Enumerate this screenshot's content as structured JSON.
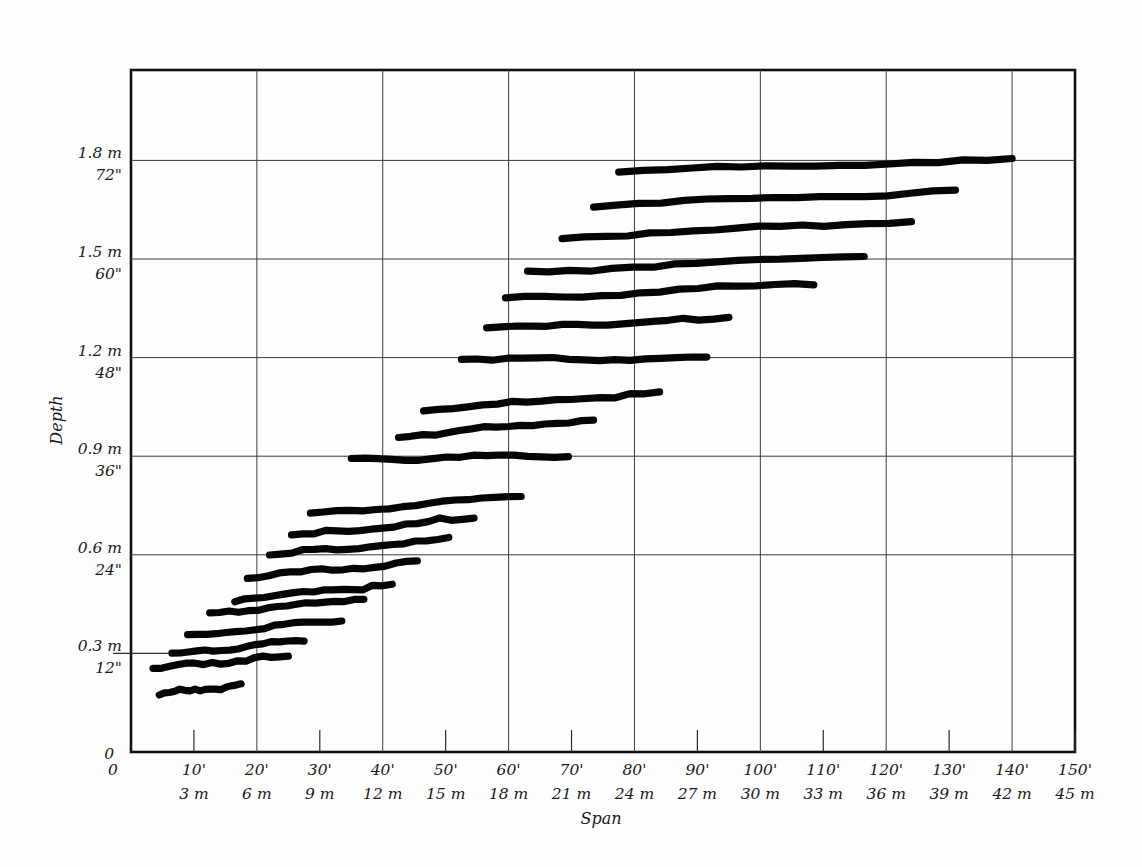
{
  "chart_data": {
    "type": "line",
    "title": "",
    "xlabel": "Span",
    "ylabel": "Depth",
    "xlim": [
      0,
      150
    ],
    "ylim": [
      0,
      2.25
    ],
    "grid": true,
    "legend_position": "none",
    "x_axis": {
      "primary_unit": "feet",
      "secondary_unit": "meters",
      "origin_label": "0",
      "ticks_feet": [
        "0",
        "10'",
        "20'",
        "30'",
        "40'",
        "50'",
        "60'",
        "70'",
        "80'",
        "90'",
        "100'",
        "110'",
        "120'",
        "130'",
        "140'",
        "150'"
      ],
      "ticks_meters": [
        "",
        "3 m",
        "6 m",
        "9 m",
        "12 m",
        "15 m",
        "18 m",
        "21 m",
        "24 m",
        "27 m",
        "30 m",
        "33 m",
        "36 m",
        "39 m",
        "42 m",
        "45 m"
      ],
      "tick_values_feet": [
        0,
        10,
        20,
        30,
        40,
        50,
        60,
        70,
        80,
        90,
        100,
        110,
        120,
        130,
        140,
        150
      ],
      "major_gridline_feet": [
        20,
        40,
        60,
        80,
        100,
        120,
        140
      ]
    },
    "y_axis": {
      "primary_unit": "meters",
      "secondary_unit": "inches",
      "origin_label": "0",
      "ticks_meters": [
        "0.3 m",
        "0.6 m",
        "0.9 m",
        "1.2 m",
        "1.5 m",
        "1.8 m"
      ],
      "ticks_inches": [
        "12\"",
        "24\"",
        "36\"",
        "48\"",
        "60\"",
        "72\""
      ],
      "tick_values_meters": [
        0.3,
        0.6,
        0.9,
        1.2,
        1.5,
        1.8
      ],
      "major_gridline_meters": [
        0.6,
        0.9,
        1.2,
        1.5,
        1.8
      ],
      "minor_tick_meters": [
        0.3
      ]
    },
    "series": [
      {
        "name": "band-01",
        "x_start_ft": 4.5,
        "x_end_ft": 17.5,
        "y_start_m": 0.175,
        "y_end_m": 0.205
      },
      {
        "name": "band-02",
        "x_start_ft": 3.5,
        "x_end_ft": 25.0,
        "y_start_m": 0.255,
        "y_end_m": 0.295
      },
      {
        "name": "band-03",
        "x_start_ft": 6.5,
        "x_end_ft": 27.5,
        "y_start_m": 0.3,
        "y_end_m": 0.34
      },
      {
        "name": "band-04",
        "x_start_ft": 9.0,
        "x_end_ft": 33.5,
        "y_start_m": 0.355,
        "y_end_m": 0.4
      },
      {
        "name": "band-05",
        "x_start_ft": 12.5,
        "x_end_ft": 37.0,
        "y_start_m": 0.42,
        "y_end_m": 0.465
      },
      {
        "name": "band-06",
        "x_start_ft": 16.5,
        "x_end_ft": 41.5,
        "y_start_m": 0.46,
        "y_end_m": 0.51
      },
      {
        "name": "band-07",
        "x_start_ft": 18.5,
        "x_end_ft": 45.5,
        "y_start_m": 0.53,
        "y_end_m": 0.58
      },
      {
        "name": "band-08",
        "x_start_ft": 22.0,
        "x_end_ft": 50.5,
        "y_start_m": 0.6,
        "y_end_m": 0.65
      },
      {
        "name": "band-09",
        "x_start_ft": 25.5,
        "x_end_ft": 54.5,
        "y_start_m": 0.66,
        "y_end_m": 0.715
      },
      {
        "name": "band-10",
        "x_start_ft": 28.5,
        "x_end_ft": 62.0,
        "y_start_m": 0.725,
        "y_end_m": 0.78
      },
      {
        "name": "band-11",
        "x_start_ft": 35.0,
        "x_end_ft": 69.5,
        "y_start_m": 0.89,
        "y_end_m": 0.9
      },
      {
        "name": "band-12",
        "x_start_ft": 42.5,
        "x_end_ft": 73.5,
        "y_start_m": 0.96,
        "y_end_m": 1.01
      },
      {
        "name": "band-13",
        "x_start_ft": 46.5,
        "x_end_ft": 84.0,
        "y_start_m": 1.04,
        "y_end_m": 1.095
      },
      {
        "name": "band-14",
        "x_start_ft": 52.5,
        "x_end_ft": 91.5,
        "y_start_m": 1.195,
        "y_end_m": 1.2
      },
      {
        "name": "band-15",
        "x_start_ft": 56.5,
        "x_end_ft": 95.0,
        "y_start_m": 1.29,
        "y_end_m": 1.32
      },
      {
        "name": "band-16",
        "x_start_ft": 59.5,
        "x_end_ft": 108.5,
        "y_start_m": 1.38,
        "y_end_m": 1.425
      },
      {
        "name": "band-17",
        "x_start_ft": 63.0,
        "x_end_ft": 116.5,
        "y_start_m": 1.46,
        "y_end_m": 1.51
      },
      {
        "name": "band-18",
        "x_start_ft": 68.5,
        "x_end_ft": 124.0,
        "y_start_m": 1.565,
        "y_end_m": 1.615
      },
      {
        "name": "band-19",
        "x_start_ft": 73.5,
        "x_end_ft": 131.0,
        "y_start_m": 1.66,
        "y_end_m": 1.71
      },
      {
        "name": "band-20",
        "x_start_ft": 77.5,
        "x_end_ft": 140.0,
        "y_start_m": 1.765,
        "y_end_m": 1.805
      }
    ]
  },
  "labels": {
    "y_axis_title": "Depth",
    "x_axis_title": "Span",
    "y_origin": "0",
    "x_origin": "0"
  }
}
